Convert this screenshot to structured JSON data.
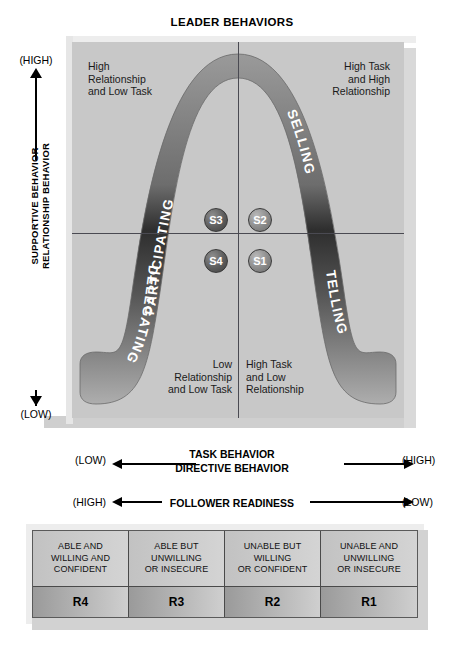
{
  "title": "LEADER BEHAVIORS",
  "chart": {
    "quadrants": {
      "top_left": "High\nRelationship\nand Low Task",
      "top_right": "High Task\nand High\nRelationship",
      "bottom_left": "Low\nRelationship\nand Low Task",
      "bottom_right": "High Task\nand Low\nRelationship"
    },
    "curve_labels": {
      "upper_left": "PARTICIPATING",
      "upper_right": "SELLING",
      "lower_left": "DELEGATING",
      "lower_right": "TELLING"
    },
    "style_nodes": [
      {
        "id": "s3",
        "label": "S3",
        "quadrant": "top-left"
      },
      {
        "id": "s2",
        "label": "S2",
        "quadrant": "top-right"
      },
      {
        "id": "s4",
        "label": "S4",
        "quadrant": "bottom-left"
      },
      {
        "id": "s1",
        "label": "S1",
        "quadrant": "bottom-right"
      }
    ]
  },
  "vertical_axis": {
    "high": "(HIGH)",
    "low": "(LOW)",
    "label_line1": "SUPPORTIVE BEHAVIOR",
    "label_line2": "RELATIONSHIP BEHAVIOR"
  },
  "horizontal_axes": [
    {
      "left": "(LOW)",
      "right": "(HIGH)",
      "center_line1": "TASK BEHAVIOR",
      "center_line2": "DIRECTIVE BEHAVIOR"
    },
    {
      "left": "(HIGH)",
      "right": "(LOW)",
      "center_line1": "FOLLOWER READINESS",
      "center_line2": ""
    }
  ],
  "readiness_table": {
    "descriptions": [
      "ABLE AND\nWILLING AND\nCONFIDENT",
      "ABLE BUT\nUNWILLING\nOR INSECURE",
      "UNABLE BUT\nWILLING\nOR CONFIDENT",
      "UNABLE AND\nUNWILLING\nOR INSECURE"
    ],
    "levels": [
      "R4",
      "R3",
      "R2",
      "R1"
    ]
  },
  "colors": {
    "frame_fill": "#c8c8c8",
    "band_dark": "#3a3a3a",
    "band_light": "#b8b8b8",
    "divider": "#4a4a52",
    "text": "#000000"
  }
}
